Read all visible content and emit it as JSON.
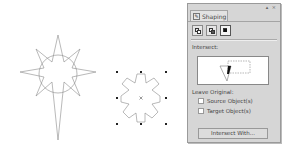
{
  "canvas": {
    "shapes": [
      {
        "name": "star-shape",
        "type": "8-point star with circle"
      },
      {
        "name": "intersect-result-shape",
        "type": "scalloped flower",
        "selected": true
      }
    ]
  },
  "panel": {
    "title_buttons": "▴ ×",
    "tab": {
      "icon": "shaping-icon",
      "label": "Shaping"
    },
    "tools": [
      {
        "name": "weld-tool",
        "active": false
      },
      {
        "name": "trim-tool",
        "active": false
      },
      {
        "name": "intersect-tool",
        "active": true
      }
    ],
    "section_label": "Intersect:",
    "leave_original_label": "Leave Original:",
    "options": [
      {
        "label": "Source Object(s)",
        "checked": false
      },
      {
        "label": "Target Object(s)",
        "checked": false
      }
    ],
    "action_button": "Intersect With..."
  }
}
